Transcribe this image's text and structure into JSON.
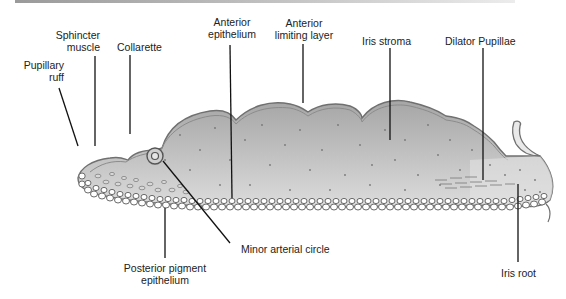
{
  "figure": {
    "colors": {
      "stroma_fill_dark": "#a9a9a9",
      "stroma_fill_light": "#e4e4e4",
      "border": "#6e6e6e",
      "epithelium_cell_fill": "#ffffff",
      "leader_line": "#111111"
    }
  },
  "labels": {
    "pupillary_ruff": [
      "Pupillary",
      "ruff"
    ],
    "sphincter_muscle": [
      "Sphincter",
      "muscle"
    ],
    "collarette": "Collarette",
    "anterior_epithelium": [
      "Anterior",
      "epithelium"
    ],
    "anterior_limiting_layer": [
      "Anterior",
      "limiting layer"
    ],
    "iris_stroma": "Iris stroma",
    "dilator_pupillae": "Dilator Pupillae",
    "minor_arterial_circle": "Minor arterial circle",
    "posterior_pigment_epithelium": [
      "Posterior pigment",
      "epithelium"
    ],
    "iris_root": "Iris root"
  }
}
